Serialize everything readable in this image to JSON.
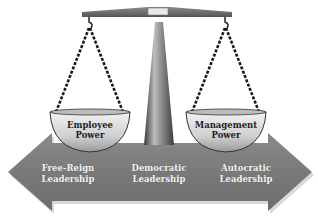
{
  "diagram": {
    "top_caption": "",
    "scale": {
      "left_pan": {
        "line1": "Employee",
        "line2": "Power"
      },
      "right_pan": {
        "line1": "Management",
        "line2": "Power"
      }
    },
    "arrow": {
      "labels": [
        {
          "line1": "Free-Reign",
          "line2": "Leadership"
        },
        {
          "line1": "Democratic",
          "line2": "Leadership"
        },
        {
          "line1": "Autocratic",
          "line2": "Leadership"
        }
      ]
    },
    "colors": {
      "arrow": "#7a7a7a",
      "beam": "#6e6e6e",
      "pan": "#d6d6d6",
      "chain": "#222222"
    }
  }
}
